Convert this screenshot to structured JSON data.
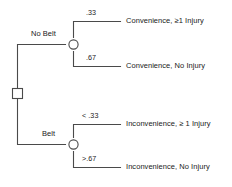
{
  "diagram": {
    "type": "decision-tree",
    "title": "",
    "line_color": "#4a4a4a",
    "text_color": "#1a1a1a",
    "decision_node": {
      "shape": "square",
      "name": "root-decision-node"
    },
    "branches": [
      {
        "id": "no-belt",
        "label": "No Belt",
        "chance_node": {
          "shape": "circle",
          "name": "chance-node-no-belt"
        },
        "outcomes": [
          {
            "probability": ".33",
            "label": "Convenience,  ≥1 Injury"
          },
          {
            "probability": ".67",
            "label": "Convenience, No Injury"
          }
        ]
      },
      {
        "id": "belt",
        "label": "Belt",
        "chance_node": {
          "shape": "circle",
          "name": "chance-node-belt"
        },
        "outcomes": [
          {
            "probability": "< .33",
            "label": "Inconvenience,  ≥ 1 Injury"
          },
          {
            "probability": ">.67",
            "label": "Inconvenience, No Injury"
          }
        ]
      }
    ]
  }
}
